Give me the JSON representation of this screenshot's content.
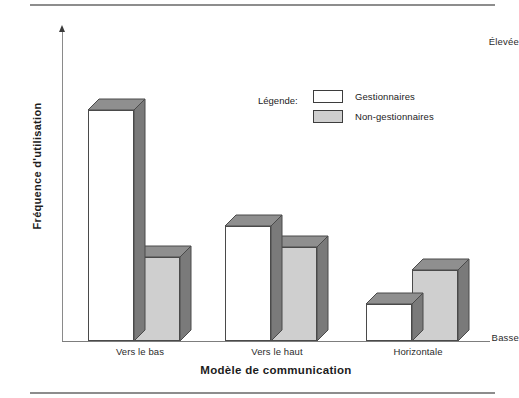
{
  "chart_data": {
    "type": "bar",
    "title": "",
    "xlabel": "Modèle de communication",
    "ylabel": "Fréquence d'utilisation",
    "categories": [
      "Vers le bas",
      "Vers le haut",
      "Horizontale"
    ],
    "series": [
      {
        "name": "Gestionnaires",
        "values": [
          88,
          44,
          14
        ],
        "color": "#ffffff"
      },
      {
        "name": "Non-gestionnaires",
        "values": [
          32,
          36,
          27
        ],
        "color": "#cfcfcf"
      }
    ],
    "ylim": [
      0,
      100
    ],
    "ytick_labels": [
      "Basse",
      "Élevée"
    ],
    "y_axis_low_label": "Basse",
    "y_axis_high_label": "Élevée",
    "grid": false,
    "legend_position": "inside-top-right",
    "style": "3d-bars"
  },
  "legend": {
    "title": "Légende:",
    "entries": [
      {
        "label": "Gestionnaires",
        "swatch": "white"
      },
      {
        "label": "Non-gestionnaires",
        "swatch": "gray"
      }
    ]
  },
  "colors": {
    "bar_white_front": "#ffffff",
    "bar_gray_front": "#cfcfcf",
    "bar_top_face": "#8f8f8f",
    "bar_side_face": "#7a7a7a",
    "outline": "#4a4a4a",
    "axis": "#8a8a8a",
    "rule": "#8d8d8d",
    "text": "#1c1c1c"
  }
}
